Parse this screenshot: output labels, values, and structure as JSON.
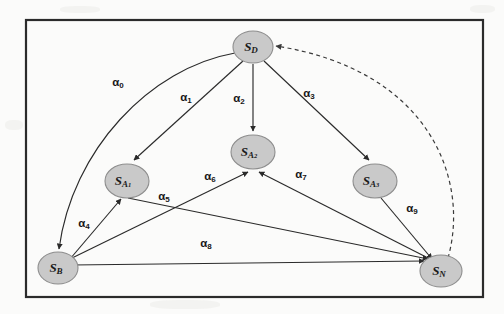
{
  "figure": {
    "background_color": "#fbfbfa",
    "frame": {
      "x": 26,
      "y": 20,
      "width": 457,
      "height": 277,
      "stroke": "#2b2b2b"
    },
    "node_fill": "#c9c9c9",
    "node_stroke": "#8d8d8d",
    "edge_color": "#2a2a2a"
  },
  "nodes": [
    {
      "id": "SD",
      "base": "S",
      "sub": "D",
      "label": "S_D",
      "x": 253,
      "y": 47,
      "rx": 20,
      "ry": 16
    },
    {
      "id": "SA1",
      "base": "S",
      "sub": "A1",
      "label": "S_A1",
      "x": 127,
      "y": 181,
      "rx": 22,
      "ry": 17
    },
    {
      "id": "SA2",
      "base": "S",
      "sub": "A2",
      "label": "S_A2",
      "x": 253,
      "y": 152,
      "rx": 22,
      "ry": 17
    },
    {
      "id": "SA3",
      "base": "S",
      "sub": "A3",
      "label": "S_A3",
      "x": 375,
      "y": 181,
      "rx": 22,
      "ry": 17
    },
    {
      "id": "SB",
      "base": "S",
      "sub": "B",
      "label": "S_B",
      "x": 58,
      "y": 268,
      "rx": 20,
      "ry": 16
    },
    {
      "id": "SN",
      "base": "S",
      "sub": "N",
      "label": "S_N",
      "x": 441,
      "y": 271,
      "rx": 21,
      "ry": 16
    }
  ],
  "edges": [
    {
      "id": "a0",
      "base": "α",
      "sub": "0",
      "label": "α0",
      "from": "SD",
      "to": "SN_curve_SB",
      "style": "curved-solid",
      "label_x": 118,
      "label_y": 82
    },
    {
      "id": "a1",
      "base": "α",
      "sub": "1",
      "label": "α1",
      "from": "SD",
      "to": "SA1",
      "style": "solid",
      "label_x": 186,
      "label_y": 97
    },
    {
      "id": "a2",
      "base": "α",
      "sub": "2",
      "label": "α2",
      "from": "SD",
      "to": "SA2",
      "style": "solid",
      "label_x": 239,
      "label_y": 98
    },
    {
      "id": "a3",
      "base": "α",
      "sub": "3",
      "label": "α3",
      "from": "SD",
      "to": "SA3",
      "style": "solid",
      "label_x": 309,
      "label_y": 93
    },
    {
      "id": "a4",
      "base": "α",
      "sub": "4",
      "label": "α4",
      "from": "SB",
      "to": "SA1",
      "style": "solid",
      "label_x": 84,
      "label_y": 223
    },
    {
      "id": "a5",
      "base": "α",
      "sub": "5",
      "label": "α5",
      "from": "SA1",
      "to": "SN",
      "style": "solid",
      "label_x": 164,
      "label_y": 196
    },
    {
      "id": "a6",
      "base": "α",
      "sub": "6",
      "label": "α6",
      "from": "SB",
      "to": "SA2",
      "style": "solid",
      "label_x": 210,
      "label_y": 176
    },
    {
      "id": "a7",
      "base": "α",
      "sub": "7",
      "label": "α7",
      "from": "SN",
      "to": "SA2",
      "style": "solid",
      "label_x": 301,
      "label_y": 174
    },
    {
      "id": "a8",
      "base": "α",
      "sub": "8",
      "label": "α8",
      "from": "SB",
      "to": "SN",
      "style": "solid",
      "label_x": 206,
      "label_y": 243
    },
    {
      "id": "a9",
      "base": "α",
      "sub": "9",
      "label": "α9",
      "from": "SA3",
      "to": "SN",
      "style": "solid",
      "label_x": 412,
      "label_y": 208
    },
    {
      "id": "feedback",
      "base": "",
      "sub": "",
      "label": "",
      "from": "SN",
      "to": "SD",
      "style": "curved-dashed",
      "label_x": 0,
      "label_y": 0
    }
  ]
}
